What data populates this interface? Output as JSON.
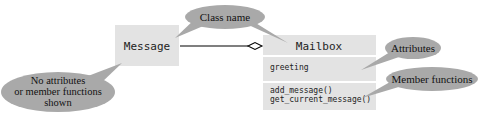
{
  "classes": {
    "message": {
      "name": "Message"
    },
    "mailbox": {
      "name": "Mailbox",
      "attributes": [
        "greeting"
      ],
      "functions": [
        "add_message()",
        "get_current_message()"
      ]
    }
  },
  "callouts": {
    "class_name": "Class name",
    "attributes": "Attributes",
    "member_functions": "Member functions",
    "no_members": [
      "No attributes",
      "or member functions",
      "shown"
    ]
  },
  "colors": {
    "box_fill": "#e3e3e3",
    "callout_fill": "#a9a9a9",
    "line": "#000000"
  }
}
